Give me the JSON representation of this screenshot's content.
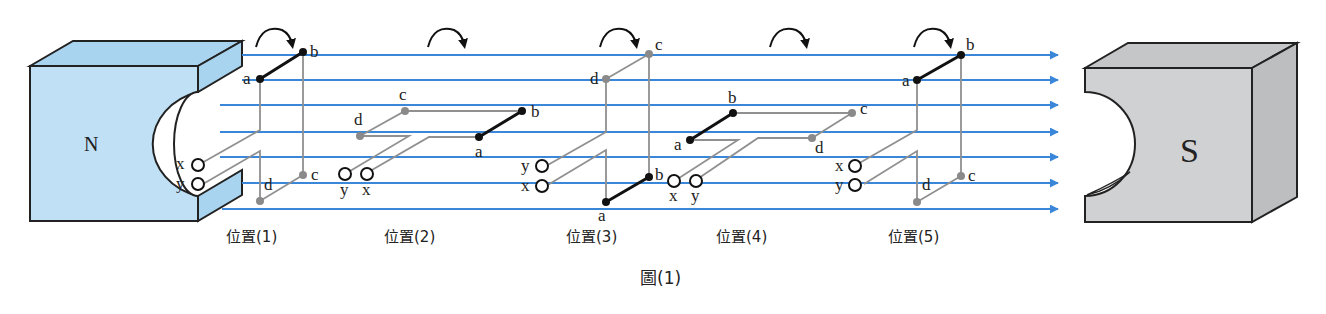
{
  "figure": {
    "caption": "圖(1)",
    "colors": {
      "field_line": "#3a86d8",
      "north_fill": "#bfe0f5",
      "south_fill": "#cfd1d3",
      "outline": "#222222",
      "coil_front": "#111111",
      "coil_back": "#909090"
    }
  },
  "magnets": {
    "north": {
      "label": "N"
    },
    "south": {
      "label": "S"
    }
  },
  "field_lines": {
    "count": 7,
    "y": [
      55,
      80,
      105,
      132,
      157,
      183,
      209
    ],
    "direction": "left-to-right"
  },
  "positions": [
    {
      "label": "位置(1)",
      "points": {
        "a": "a",
        "b": "b",
        "c": "c",
        "d": "d"
      },
      "terminals": [
        "x",
        "y"
      ]
    },
    {
      "label": "位置(2)",
      "points": {
        "a": "a",
        "b": "b",
        "c": "c",
        "d": "d"
      },
      "terminals": [
        "y",
        "x"
      ]
    },
    {
      "label": "位置(3)",
      "points": {
        "a": "a",
        "b": "b",
        "c": "c",
        "d": "d"
      },
      "terminals": [
        "y",
        "x"
      ]
    },
    {
      "label": "位置(4)",
      "points": {
        "a": "a",
        "b": "b",
        "c": "c",
        "d": "d"
      },
      "terminals": [
        "x",
        "y"
      ]
    },
    {
      "label": "位置(5)",
      "points": {
        "a": "a",
        "b": "b",
        "c": "c",
        "d": "d"
      },
      "terminals": [
        "x",
        "y"
      ]
    }
  ],
  "rotation_arrows": {
    "count": 5,
    "direction": "clockwise"
  }
}
